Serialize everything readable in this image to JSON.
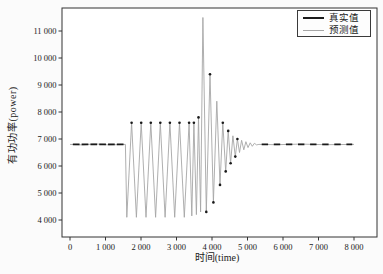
{
  "figure": {
    "background": "#fbfbfb",
    "title": "",
    "x_axis": {
      "label": "时间(time)",
      "ticks": [
        {
          "t": 0,
          "label": "0"
        },
        {
          "t": 1000,
          "label": "1 000"
        },
        {
          "t": 2000,
          "label": "2 000"
        },
        {
          "t": 3000,
          "label": "3 000"
        },
        {
          "t": 4000,
          "label": "4 000"
        },
        {
          "t": 5000,
          "label": "5 000"
        },
        {
          "t": 6000,
          "label": "6 000"
        },
        {
          "t": 7000,
          "label": "7 000"
        },
        {
          "t": 8000,
          "label": "8 000"
        }
      ]
    },
    "y_axis": {
      "label": "有功功率(power)",
      "ticks": [
        {
          "v": 4000,
          "label": "4 000"
        },
        {
          "v": 5000,
          "label": "5 000"
        },
        {
          "v": 6000,
          "label": "6 000"
        },
        {
          "v": 7000,
          "label": "7 000"
        },
        {
          "v": 8000,
          "label": "8 000"
        },
        {
          "v": 9000,
          "label": "9 000"
        },
        {
          "v": 10000,
          "label": "10 000"
        },
        {
          "v": 11000,
          "label": "11 000"
        }
      ]
    },
    "legend": {
      "items": [
        {
          "label": "真实值",
          "color": "#1a1a1a",
          "style": "thick"
        },
        {
          "label": "预测值",
          "color": "#a6a6a6",
          "style": "thin"
        }
      ]
    }
  },
  "chart_data": {
    "type": "line",
    "title": "",
    "xlabel": "时间(time)",
    "ylabel": "有功功率(power)",
    "xlim": [
      -300,
      8500
    ],
    "ylim": [
      3350,
      11850
    ],
    "x_ticks": [
      0,
      1000,
      2000,
      3000,
      4000,
      5000,
      6000,
      7000,
      8000
    ],
    "y_ticks": [
      4000,
      5000,
      6000,
      7000,
      8000,
      9000,
      10000,
      11000
    ],
    "grid": false,
    "legend_position": "upper right",
    "baseline_value": 6800,
    "series": [
      {
        "name": "预测值",
        "role": "predicted",
        "color": "#a6a6a6",
        "line_width": 0.9,
        "keypoints": [
          [
            0,
            6800
          ],
          [
            350,
            6780
          ],
          [
            700,
            6820
          ],
          [
            1100,
            6780
          ],
          [
            1560,
            6800
          ],
          [
            1600,
            4100
          ],
          [
            1735,
            7600
          ],
          [
            1870,
            4100
          ],
          [
            2005,
            7600
          ],
          [
            2140,
            4100
          ],
          [
            2275,
            7600
          ],
          [
            2410,
            4100
          ],
          [
            2545,
            7600
          ],
          [
            2680,
            4100
          ],
          [
            2815,
            7600
          ],
          [
            2950,
            4100
          ],
          [
            3085,
            7600
          ],
          [
            3220,
            4100
          ],
          [
            3355,
            7600
          ],
          [
            3430,
            4150
          ],
          [
            3490,
            7600
          ],
          [
            3560,
            4200
          ],
          [
            3620,
            7800
          ],
          [
            3680,
            4300
          ],
          [
            3745,
            11500
          ],
          [
            3840,
            4300
          ],
          [
            3945,
            9400
          ],
          [
            4040,
            4650
          ],
          [
            4135,
            8400
          ],
          [
            4225,
            5300
          ],
          [
            4305,
            7600
          ],
          [
            4385,
            5800
          ],
          [
            4455,
            7300
          ],
          [
            4525,
            6100
          ],
          [
            4590,
            7120
          ],
          [
            4655,
            6350
          ],
          [
            4715,
            7000
          ],
          [
            4775,
            6500
          ],
          [
            4835,
            6950
          ],
          [
            4895,
            6600
          ],
          [
            4955,
            6900
          ],
          [
            5015,
            6680
          ],
          [
            5075,
            6860
          ],
          [
            5135,
            6730
          ],
          [
            5195,
            6840
          ],
          [
            5255,
            6780
          ],
          [
            5320,
            6800
          ],
          [
            5800,
            6790
          ],
          [
            6500,
            6810
          ],
          [
            7200,
            6790
          ],
          [
            8000,
            6800
          ]
        ]
      },
      {
        "name": "真实值",
        "role": "actual",
        "color": "#1a1a1a",
        "marker_radius": 1.3,
        "markers": [
          [
            1735,
            7600
          ],
          [
            2005,
            7600
          ],
          [
            2275,
            7600
          ],
          [
            2545,
            7600
          ],
          [
            2815,
            7600
          ],
          [
            3085,
            7600
          ],
          [
            3355,
            7600
          ],
          [
            3490,
            7600
          ],
          [
            3620,
            7800
          ],
          [
            3840,
            4300
          ],
          [
            3945,
            9400
          ],
          [
            4040,
            4650
          ],
          [
            4225,
            5300
          ],
          [
            4305,
            7600
          ],
          [
            4385,
            5800
          ],
          [
            4455,
            7300
          ],
          [
            4525,
            6100
          ],
          [
            4655,
            6350
          ],
          [
            4715,
            7000
          ]
        ],
        "dash_runs": [
          {
            "t_start": 80,
            "t_end": 1545,
            "value": 6800,
            "dash": 190,
            "gap": 60
          },
          {
            "t_start": 5400,
            "t_end": 7950,
            "value": 6800,
            "dash": 180,
            "gap": 160
          }
        ]
      }
    ]
  }
}
